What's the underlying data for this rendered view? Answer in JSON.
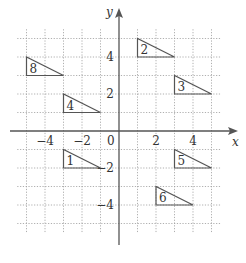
{
  "axes": {
    "x_label": "x",
    "y_label": "y",
    "origin_label": "0",
    "x_tick_labels": [
      {
        "value": -4,
        "text": "−4"
      },
      {
        "value": -2,
        "text": "−2"
      },
      {
        "value": 2,
        "text": "2"
      },
      {
        "value": 4,
        "text": "4"
      }
    ],
    "y_tick_labels": [
      {
        "value": 4,
        "text": "4"
      },
      {
        "value": 2,
        "text": "2"
      },
      {
        "value": -2,
        "text": "−2"
      },
      {
        "value": -4,
        "text": "−4"
      }
    ],
    "range": {
      "xmin": -5.5,
      "xmax": 5.5,
      "ymin": -5.5,
      "ymax": 5.5
    }
  },
  "triangles": [
    {
      "label": "1",
      "points": [
        [
          -3,
          -1
        ],
        [
          -3,
          -2
        ],
        [
          -1,
          -2
        ]
      ]
    },
    {
      "label": "2",
      "points": [
        [
          1,
          5
        ],
        [
          1,
          4
        ],
        [
          3,
          4
        ]
      ]
    },
    {
      "label": "3",
      "points": [
        [
          3,
          3
        ],
        [
          3,
          2
        ],
        [
          5,
          2
        ]
      ]
    },
    {
      "label": "4",
      "points": [
        [
          -3,
          2
        ],
        [
          -3,
          1
        ],
        [
          -1,
          1
        ]
      ]
    },
    {
      "label": "5",
      "points": [
        [
          3,
          -1
        ],
        [
          3,
          -2
        ],
        [
          5,
          -2
        ]
      ]
    },
    {
      "label": "6",
      "points": [
        [
          2,
          -3
        ],
        [
          2,
          -4
        ],
        [
          4,
          -4
        ]
      ]
    },
    {
      "label": "8",
      "points": [
        [
          -5,
          4
        ],
        [
          -5,
          3
        ],
        [
          -3,
          3
        ]
      ]
    }
  ],
  "colors": {
    "stroke": "#555555",
    "grid": "#9a9a9a",
    "background": "#ffffff"
  }
}
